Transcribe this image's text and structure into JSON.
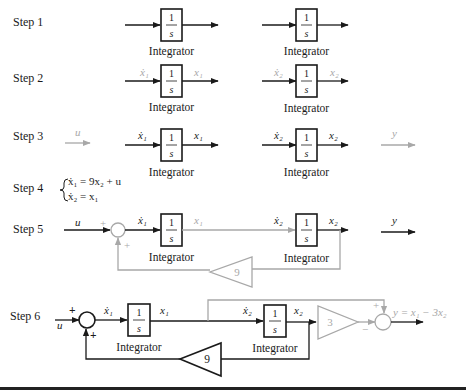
{
  "figure": {
    "block_label": "Integrator",
    "integrator_num": "1",
    "integrator_den": "s",
    "colors": {
      "primary": "#1a1a1a",
      "highlight": "#a8a8a8",
      "background": "#ffffff"
    }
  },
  "steps": [
    {
      "label": "Step 1"
    },
    {
      "label": "Step 2",
      "signals": {
        "in1": "ẋ₁",
        "out1": "x₁",
        "in2": "ẋ₂",
        "out2": "x₂"
      }
    },
    {
      "label": "Step 3",
      "signals": {
        "u": "u",
        "in1": "ẋ₁",
        "out1": "x₁",
        "in2": "ẋ₂",
        "out2": "x₂",
        "y": "y"
      }
    },
    {
      "label": "Step 4",
      "equations": [
        "ẋ₁ = 9x₂ + u",
        "ẋ₂ = x₁"
      ]
    },
    {
      "label": "Step 5",
      "signals": {
        "u": "u",
        "in1": "ẋ₁",
        "out1": "x₁",
        "in2": "ẋ₂",
        "out2": "x₂",
        "y": "y"
      },
      "sum_signs": [
        "+",
        "+"
      ],
      "gain": "9"
    },
    {
      "label": "Step 6",
      "signals": {
        "u": "u",
        "in1": "ẋ₁",
        "out1": "x₁",
        "in2": "ẋ₂",
        "out2": "x₂",
        "y_expr": "y = x₁ − 3x₂"
      },
      "sum1_signs": [
        "+",
        "+"
      ],
      "sum2_signs": [
        "+",
        "−"
      ],
      "gain_feedback": "9",
      "gain_output": "3"
    }
  ]
}
